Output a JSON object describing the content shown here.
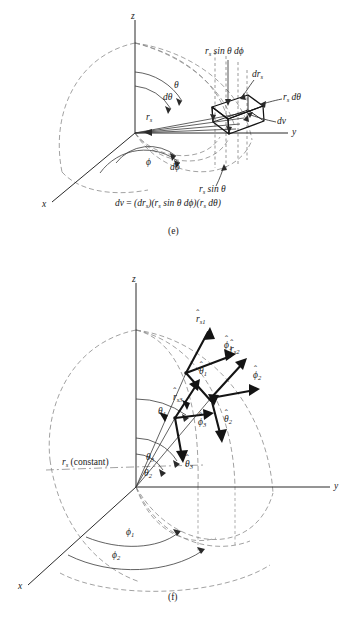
{
  "figure": {
    "title_implicit": "Spherical coordinate system differential volume and unit vectors",
    "colors": {
      "ink": "#1a1a1a",
      "dashed": "#8a8a8a",
      "solid_axis": "#3a3a3a",
      "background": "#ffffff"
    }
  },
  "panel_e": {
    "caption": "(e)",
    "axes": {
      "x": "x",
      "y": "y",
      "z": "z"
    },
    "labels": {
      "r_s": "r",
      "r_s_sub": "s",
      "theta": "θ",
      "d_theta": "dθ",
      "phi": "ϕ",
      "d_phi": "dϕ",
      "dr_s": "dr",
      "dr_s_sub": "s",
      "r_sin_theta_dphi": "sin θ dϕ",
      "r_sin_theta_dphi_lead": "r",
      "r_sin_theta_dphi_sub": "s",
      "r_dtheta_lead": "r",
      "r_dtheta_sub": "s",
      "r_dtheta_rest": " dθ",
      "dv": "dv",
      "r_sin_theta_lead": "r",
      "r_sin_theta_sub": "s",
      "r_sin_theta_rest": " sin θ"
    },
    "equation": {
      "lhs": "dv",
      "eq": " = ",
      "term1_open": "(dr",
      "term1_sub": "s",
      "term1_close": ")",
      "term2_open": "(r",
      "term2_sub": "s",
      "term2_close": " sin θ dϕ)",
      "term3_open": "(r",
      "term3_sub": "s",
      "term3_close": " dθ)",
      "full_text": "dv = (drₛ)(rₛ sin θ dϕ)(rₛ dθ)"
    }
  },
  "panel_f": {
    "caption": "(f)",
    "axes": {
      "x": "x",
      "y": "y",
      "z": "z"
    },
    "radius_note_lead": "r",
    "radius_note_sub": "s",
    "radius_note_rest": " (constant)",
    "angles": [
      {
        "name": "theta-1",
        "text": "θ",
        "sub": "1"
      },
      {
        "name": "theta-3",
        "text": "θ",
        "sub": "3"
      },
      {
        "name": "theta-2",
        "text": "θ",
        "sub": "2"
      },
      {
        "name": "phi-1",
        "text": "ϕ",
        "sub": "1"
      },
      {
        "name": "phi-2",
        "text": "ϕ",
        "sub": "2"
      }
    ],
    "unit_vectors": [
      {
        "name": "r-hat-s1",
        "base": "r",
        "sub": "s",
        "index": "1",
        "hat": "̂"
      },
      {
        "name": "phi-hat-1",
        "base": "ϕ",
        "sub": "",
        "index": "1",
        "hat": "̂"
      },
      {
        "name": "theta-hat-1",
        "base": "θ",
        "sub": "",
        "index": "1",
        "hat": "̂"
      },
      {
        "name": "r-hat-s2",
        "base": "r",
        "sub": "s",
        "index": "2",
        "hat": "̂"
      },
      {
        "name": "phi-hat-2",
        "base": "ϕ",
        "sub": "",
        "index": "2",
        "hat": "̂"
      },
      {
        "name": "theta-hat-2",
        "base": "θ",
        "sub": "",
        "index": "2",
        "hat": "̂"
      },
      {
        "name": "r-hat-s3",
        "base": "r",
        "sub": "s",
        "index": "3",
        "hat": "̂"
      },
      {
        "name": "phi-hat-3",
        "base": "ϕ",
        "sub": "",
        "index": "3",
        "hat": "̂"
      },
      {
        "name": "theta-hat-3",
        "base": "θ",
        "sub": "",
        "index": "3",
        "hat": "̂"
      }
    ]
  }
}
